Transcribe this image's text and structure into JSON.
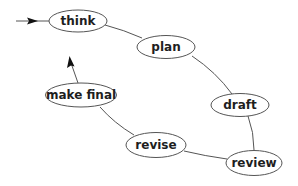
{
  "diagram": {
    "type": "cycle-flow",
    "colors": {
      "stroke": "#555555",
      "text": "#1e1e1e",
      "arrowhead": "#111111",
      "background": "#ffffff"
    },
    "nodes": [
      {
        "id": "think",
        "label": "think"
      },
      {
        "id": "plan",
        "label": "plan"
      },
      {
        "id": "draft",
        "label": "draft"
      },
      {
        "id": "review",
        "label": "review"
      },
      {
        "id": "revise",
        "label": "revise"
      },
      {
        "id": "make_final",
        "label": "make final"
      }
    ],
    "edges": [
      {
        "from": "start",
        "to": "think",
        "arrow": true
      },
      {
        "from": "think",
        "to": "plan",
        "arrow": false
      },
      {
        "from": "plan",
        "to": "draft",
        "arrow": false
      },
      {
        "from": "draft",
        "to": "review",
        "arrow": false
      },
      {
        "from": "review",
        "to": "revise",
        "arrow": false
      },
      {
        "from": "revise",
        "to": "make_final",
        "arrow": false
      },
      {
        "from": "make_final",
        "to": "think",
        "arrow": true
      }
    ]
  }
}
